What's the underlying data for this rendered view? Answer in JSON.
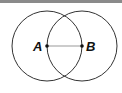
{
  "diagram": {
    "type": "geometric-construction",
    "points": [
      {
        "label": "A",
        "x": 47,
        "y": 46
      },
      {
        "label": "B",
        "x": 82,
        "y": 46
      }
    ],
    "circles": [
      {
        "center": "A",
        "radius": 35
      },
      {
        "center": "B",
        "radius": 35
      }
    ],
    "segment": {
      "from": "A",
      "to": "B"
    },
    "colors": {
      "stroke": "#333333",
      "segment": "#999999",
      "topbar": "#8a8a8a"
    }
  }
}
